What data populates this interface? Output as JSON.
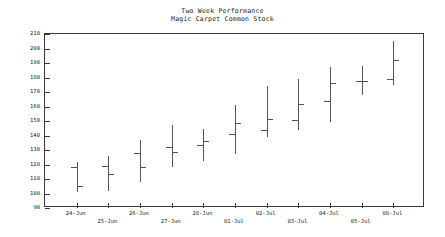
{
  "chart_data": {
    "type": "ohlc",
    "title": "Two Week Performance",
    "subtitle": "Magic Carpet Common Stock",
    "xlabel": "",
    "ylabel": "",
    "ylim": [
      90,
      210
    ],
    "ytick_step": 10,
    "yticks": [
      210,
      200,
      190,
      180,
      170,
      160,
      150,
      140,
      130,
      120,
      110,
      100,
      90
    ],
    "grid": false,
    "legend": false,
    "categories": [
      "24-Jun",
      "25-Jun",
      "26-Jun",
      "27-Jun",
      "28-Jun",
      "01-Jul",
      "02-Jul",
      "03-Jul",
      "04-Jul",
      "05-Jul",
      "08-Jul"
    ],
    "series_name": "Magic Carpet Common Stock",
    "bars": [
      {
        "date": "24-Jun",
        "open": 118.5,
        "high": 122.0,
        "low": 101.0,
        "close": 105.5
      },
      {
        "date": "25-Jun",
        "open": 119.0,
        "high": 126.0,
        "low": 102.0,
        "close": 113.5
      },
      {
        "date": "26-Jun",
        "open": 128.0,
        "high": 137.0,
        "low": 108.0,
        "close": 118.5
      },
      {
        "date": "27-Jun",
        "open": 132.0,
        "high": 147.0,
        "low": 118.0,
        "close": 128.5
      },
      {
        "date": "28-Jun",
        "open": 133.5,
        "high": 144.5,
        "low": 122.5,
        "close": 136.5
      },
      {
        "date": "01-Jul",
        "open": 141.0,
        "high": 161.0,
        "low": 127.0,
        "close": 148.5
      },
      {
        "date": "02-Jul",
        "open": 143.5,
        "high": 174.0,
        "low": 139.0,
        "close": 151.5
      },
      {
        "date": "03-Jul",
        "open": 151.0,
        "high": 179.0,
        "low": 143.5,
        "close": 162.0
      },
      {
        "date": "04-Jul",
        "open": 164.0,
        "high": 187.0,
        "low": 149.5,
        "close": 176.5
      },
      {
        "date": "05-Jul",
        "open": 177.5,
        "high": 188.0,
        "low": 168.0,
        "close": 177.5
      },
      {
        "date": "08-Jul",
        "open": 179.0,
        "high": 205.0,
        "low": 175.0,
        "close": 192.0
      }
    ]
  },
  "colors": {
    "background": "#ffffff",
    "axis": "#3a3a3a",
    "bar": "#555555",
    "text": "#1a1a1a"
  }
}
